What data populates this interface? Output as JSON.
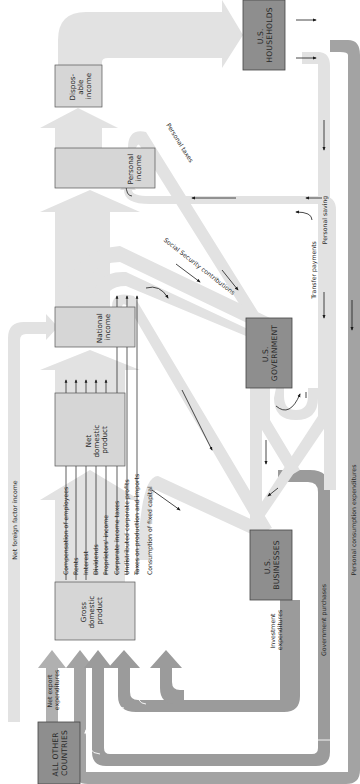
{
  "colors": {
    "flow_light": "#e2e2e2",
    "flow_dark": "#9b9b9b",
    "box_light": "#d6d6d6",
    "sector_box": "#8e8e8e",
    "arrow": "#1a1a1a",
    "background": "#ffffff"
  },
  "accounts": {
    "gdp": [
      "Gross",
      "domestic",
      "product"
    ],
    "ndp": [
      "Net",
      "domestic",
      "product"
    ],
    "national_income": [
      "National",
      "income"
    ],
    "personal_income": [
      "Personal",
      "income"
    ],
    "disposable_income": [
      "Dispos-",
      "able",
      "income"
    ]
  },
  "sectors": {
    "households": [
      "U.S.",
      "HOUSEHOLDS"
    ],
    "government": [
      "U.S.",
      "GOVERNMENT"
    ],
    "businesses": [
      "U.S.",
      "BUSINESSES"
    ],
    "other_countries": [
      "ALL OTHER",
      "COUNTRIES"
    ]
  },
  "income_components": [
    "Compensation of employees",
    "Rents",
    "Interest",
    "Dividends",
    "Proprietors' income",
    "Corporate income taxes",
    "Undistributed corporate profits",
    "Taxes on production and imports"
  ],
  "flows": {
    "consumption_fixed_capital": "Consumption of fixed capital",
    "net_foreign_factor_income": "Net foreign factor income",
    "net_export_expenditures": [
      "Net export",
      "expenditures"
    ],
    "investment_expenditures": [
      "Investment",
      "expenditures"
    ],
    "government_purchases": "Government purchases",
    "personal_consumption_expenditures": "Personal consumption expenditures",
    "personal_taxes": "Personal taxes",
    "social_security_contributions": "Social Security contributions",
    "transfer_payments": "Transfer payments",
    "personal_saving": "Personal saving"
  }
}
